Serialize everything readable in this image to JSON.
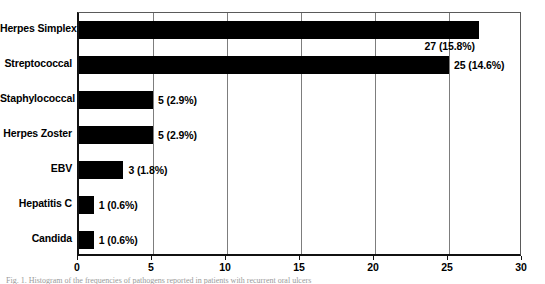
{
  "figure": {
    "caption": "Fig. 1. Histogram of the frequencies of pathogens reported in patients with recurrent oral ulcers"
  },
  "chart_data": {
    "type": "bar",
    "orientation": "horizontal",
    "title": "",
    "xlabel": "",
    "ylabel": "",
    "xlim": [
      0,
      30
    ],
    "xticks": [
      0,
      5,
      10,
      15,
      20,
      25,
      30
    ],
    "grid": true,
    "legend": null,
    "bar_color": "#000000",
    "categories": [
      "Herpes Simplex",
      "Streptococcal",
      "Staphylococcal",
      "Herpes Zoster",
      "EBV",
      "Hepatitis C",
      "Candida"
    ],
    "values": [
      27,
      25,
      5,
      5,
      3,
      1,
      1
    ],
    "percents": [
      15.8,
      14.6,
      2.9,
      2.9,
      1.8,
      0.6,
      0.6
    ],
    "data_labels": [
      "27 (15.8%)",
      "25 (14.6%)",
      "5 (2.9%)",
      "5 (2.9%)",
      "3 (1.8%)",
      "1 (0.6%)",
      "1 (0.6%)"
    ],
    "label_placement": [
      "below-right",
      "right",
      "right",
      "right",
      "right",
      "right",
      "right"
    ]
  }
}
